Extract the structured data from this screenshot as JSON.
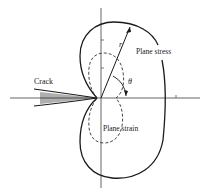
{
  "diagram": {
    "type": "plastic zone shape around crack tip",
    "labels": {
      "crack": "Crack",
      "plane_stress": "Plane stress",
      "plane_strain": "Plane strain",
      "radius": "r",
      "angle": "θ"
    },
    "colors": {
      "line": "#1a1a1a",
      "axis": "#555555",
      "background": "#ffffff"
    }
  }
}
